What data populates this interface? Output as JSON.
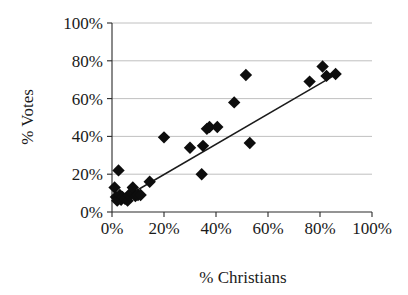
{
  "chart_data": {
    "type": "scatter",
    "title": "",
    "xlabel": "% Christians",
    "ylabel": "% Votes",
    "xlim": [
      0,
      100
    ],
    "ylim": [
      0,
      100
    ],
    "x_ticks": [
      "0%",
      "20%",
      "40%",
      "60%",
      "80%",
      "100%"
    ],
    "y_ticks": [
      "0%",
      "20%",
      "40%",
      "60%",
      "80%",
      "100%"
    ],
    "x_tick_values": [
      0,
      20,
      40,
      60,
      80,
      100
    ],
    "y_tick_values": [
      0,
      20,
      40,
      60,
      80,
      100
    ],
    "grid": "horizontal",
    "legend": "none",
    "marker_shape": "diamond",
    "marker_color": "#0d0d0d",
    "series": [
      {
        "name": "observations",
        "points": [
          [
            1,
            13
          ],
          [
            1.5,
            8
          ],
          [
            2,
            6
          ],
          [
            2.5,
            22
          ],
          [
            3,
            9
          ],
          [
            3.5,
            6.5
          ],
          [
            4,
            8
          ],
          [
            5,
            7
          ],
          [
            6,
            6
          ],
          [
            6.5,
            9
          ],
          [
            7.5,
            10
          ],
          [
            8,
            13
          ],
          [
            9,
            8.5
          ],
          [
            10,
            9
          ],
          [
            11,
            9
          ],
          [
            14.5,
            16
          ],
          [
            20,
            39.5
          ],
          [
            30,
            34
          ],
          [
            34.5,
            20
          ],
          [
            35,
            35
          ],
          [
            36.5,
            44
          ],
          [
            37.5,
            45
          ],
          [
            40.5,
            45
          ],
          [
            47,
            58
          ],
          [
            51.5,
            72.5
          ],
          [
            53,
            36.5
          ],
          [
            76,
            69
          ],
          [
            81,
            77
          ],
          [
            82.5,
            72
          ],
          [
            86,
            73
          ]
        ]
      }
    ],
    "trendline": {
      "visible": true,
      "x_start": 4,
      "y_start": 7,
      "x_end": 87,
      "y_end": 73.5
    }
  },
  "axes": {
    "x_title": "% Christians",
    "y_title": "% Votes"
  }
}
